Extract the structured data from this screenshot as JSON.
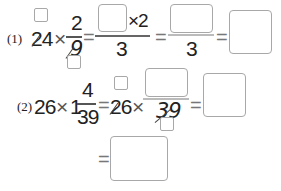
{
  "problem1": {
    "label": "(1)",
    "whole": "24",
    "times": "×",
    "numerator": "2",
    "denominator": "9",
    "eq1": "=",
    "step1_times": "×2",
    "step1_denominator": "3",
    "eq2": "=",
    "step2_denominator": "3",
    "eq3": "="
  },
  "problem2": {
    "label": "(2)",
    "whole": "26",
    "times": "×",
    "mixed_whole": "1",
    "numerator": "4",
    "denominator": "39",
    "eq1": "=",
    "whole2": "26",
    "times2": "×",
    "step1_denominator": "39",
    "eq2": "=",
    "eq3": "="
  }
}
